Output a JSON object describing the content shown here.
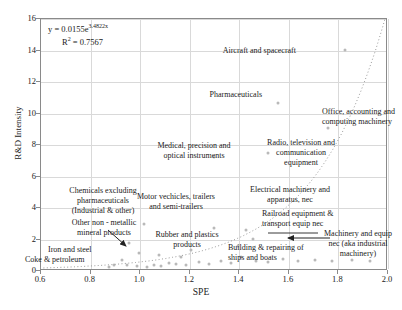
{
  "chart_data": {
    "type": "scatter",
    "title": "",
    "xlabel": "SPE",
    "ylabel": "R&D Intensity",
    "xlim": [
      0.6,
      2.0
    ],
    "ylim": [
      0,
      16
    ],
    "xticks": [
      "0.6",
      "0.8",
      "1.0",
      "1.2",
      "1.4",
      "1.6",
      "1.8",
      "2.0"
    ],
    "yticks": [
      "0",
      "2",
      "4",
      "6",
      "8",
      "10",
      "12",
      "14",
      "16"
    ],
    "grid": true,
    "legend": "none",
    "annotations": {
      "equation": "y = 0.0155e",
      "equation_exponent": "3.4822x",
      "r_squared": "R",
      "r_squared_sup": "2",
      "r_squared_value": "= 0.7567"
    },
    "trendline": {
      "type": "exponential",
      "a": 0.0155,
      "b": 3.4822,
      "r2": 0.7567,
      "style": "dotted"
    },
    "points": [
      {
        "label": "Aircraft and spacecraft",
        "x": 1.83,
        "y": 14.0
      },
      {
        "label": "Pharmaceuticals",
        "x": 1.56,
        "y": 10.6
      },
      {
        "label": "Office, accounting and computing machinery",
        "x": 1.76,
        "y": 9.0
      },
      {
        "label": "Radio, television and communication equipment",
        "x": 1.52,
        "y": 7.4
      },
      {
        "label": "Medical, precision and optical instruments",
        "x": 1.3,
        "y": 7.2
      },
      {
        "label": "Chemicals excluding pharmaceuticals (Industrial & other)",
        "x": 1.02,
        "y": 2.95
      },
      {
        "label": "Motor vechicles, trailers and semi-trailers",
        "x": 1.3,
        "y": 2.65
      },
      {
        "label": "Electrical machinery and apparatus, nec",
        "x": 1.43,
        "y": 2.55
      },
      {
        "label": "Railroad equipment & transport equip nec",
        "x": 1.46,
        "y": 1.95
      },
      {
        "label": "Machinery and equip nec (aka industrial machinery)",
        "x": 1.4,
        "y": 1.55
      },
      {
        "label": "Other non - metallic mineral products",
        "x": 1.0,
        "y": 1.05
      },
      {
        "label": "Rubber and plastics products",
        "x": 1.21,
        "y": 1.3
      },
      {
        "label": "Building & repairing of ships and boats",
        "x": 1.41,
        "y": 0.85
      },
      {
        "label": "Iron and steel",
        "x": 0.93,
        "y": 0.65
      },
      {
        "label": "Coke & petroleum",
        "x": 0.9,
        "y": 0.3
      }
    ],
    "unlabeled_points": [
      {
        "x": 0.88,
        "y": 0.22
      },
      {
        "x": 0.95,
        "y": 0.3
      },
      {
        "x": 0.99,
        "y": 0.26
      },
      {
        "x": 1.03,
        "y": 0.2
      },
      {
        "x": 1.06,
        "y": 0.32
      },
      {
        "x": 1.09,
        "y": 0.28
      },
      {
        "x": 1.12,
        "y": 0.45
      },
      {
        "x": 1.15,
        "y": 0.38
      },
      {
        "x": 1.19,
        "y": 0.3
      },
      {
        "x": 1.24,
        "y": 0.48
      },
      {
        "x": 1.28,
        "y": 0.4
      },
      {
        "x": 1.33,
        "y": 0.55
      },
      {
        "x": 1.37,
        "y": 0.45
      },
      {
        "x": 1.47,
        "y": 0.6
      },
      {
        "x": 1.52,
        "y": 0.5
      },
      {
        "x": 1.58,
        "y": 0.7
      },
      {
        "x": 1.64,
        "y": 0.55
      },
      {
        "x": 1.71,
        "y": 0.65
      },
      {
        "x": 1.78,
        "y": 0.55
      },
      {
        "x": 1.86,
        "y": 0.62
      },
      {
        "x": 1.93,
        "y": 0.58
      },
      {
        "x": 0.96,
        "y": 1.7
      },
      {
        "x": 1.08,
        "y": 0.95
      },
      {
        "x": 1.17,
        "y": 0.8
      }
    ]
  },
  "labels": {
    "aircraft": "Aircraft and spacecraft",
    "pharmaceuticals": "Pharmaceuticals",
    "office": "Office, accounting and\ncomputing machinery",
    "radio": "Radio, television and\ncommunication\nequipment",
    "medical": "Medical, precision and\noptical instruments",
    "chemicals": "Chemicals excluding\npharmaceuticals\n(Industrial & other)",
    "motor": "Motor vechicles, trailers\nand semi-trailers",
    "electrical": "Electrical machinery and\napparatus, nec",
    "railroad": "Railroad equipment &\ntransport equip nec",
    "machinery": "Machinery and equip\nnec (aka industrial\nmachinery)",
    "nonmetallic": "Other non - metallic\nmineral products",
    "rubber": "Rubber and plastics\nproducts",
    "ships": "Building & repairing of\nships and boats",
    "iron": "Iron and steel",
    "coke": "Coke & petroleum"
  }
}
